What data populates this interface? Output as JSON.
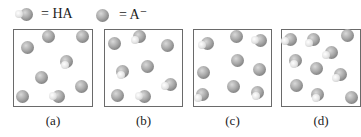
{
  "legend": [
    {
      "species": "HA",
      "label": "= HA",
      "symbol": "ha-molecule"
    },
    {
      "species": "A-",
      "label": "= A⁻",
      "symbol": "a-minus-ion"
    }
  ],
  "colors": {
    "sphere": "#9a9a9a",
    "hydrogen": "#eeeeee",
    "border": "#6a6a6a"
  },
  "panels": [
    {
      "label": "(a)",
      "x": 13,
      "width": 80,
      "particles": [
        {
          "type": "A-",
          "x": 49,
          "y": 37
        },
        {
          "type": "A-",
          "x": 83,
          "y": 37
        },
        {
          "type": "A-",
          "x": 28,
          "y": 48
        },
        {
          "type": "HA",
          "x": 67,
          "y": 62
        },
        {
          "type": "A-",
          "x": 42,
          "y": 78
        },
        {
          "type": "A-",
          "x": 82,
          "y": 87
        },
        {
          "type": "A-",
          "x": 23,
          "y": 97
        },
        {
          "type": "HA",
          "x": 59,
          "y": 97
        }
      ]
    },
    {
      "label": "(b)",
      "x": 104,
      "width": 79,
      "particles": [
        {
          "type": "A-",
          "x": 115,
          "y": 44
        },
        {
          "type": "HA",
          "x": 140,
          "y": 37
        },
        {
          "type": "A-",
          "x": 168,
          "y": 46
        },
        {
          "type": "HA",
          "x": 123,
          "y": 72
        },
        {
          "type": "A-",
          "x": 148,
          "y": 67
        },
        {
          "type": "HA",
          "x": 171,
          "y": 85
        },
        {
          "type": "A-",
          "x": 118,
          "y": 96
        },
        {
          "type": "HA",
          "x": 145,
          "y": 97
        }
      ]
    },
    {
      "label": "(c)",
      "x": 193,
      "width": 79,
      "particles": [
        {
          "type": "HA",
          "x": 208,
          "y": 44
        },
        {
          "type": "A-",
          "x": 237,
          "y": 37
        },
        {
          "type": "HA",
          "x": 261,
          "y": 41
        },
        {
          "type": "A-",
          "x": 238,
          "y": 61
        },
        {
          "type": "A-",
          "x": 204,
          "y": 73
        },
        {
          "type": "A-",
          "x": 260,
          "y": 70
        },
        {
          "type": "HA",
          "x": 203,
          "y": 95
        },
        {
          "type": "A-",
          "x": 234,
          "y": 87
        },
        {
          "type": "HA",
          "x": 258,
          "y": 93
        }
      ]
    },
    {
      "label": "(d)",
      "x": 281,
      "width": 80,
      "particles": [
        {
          "type": "HA",
          "x": 291,
          "y": 40
        },
        {
          "type": "HA",
          "x": 314,
          "y": 40
        },
        {
          "type": "A-",
          "x": 348,
          "y": 36
        },
        {
          "type": "HA",
          "x": 296,
          "y": 61
        },
        {
          "type": "HA",
          "x": 332,
          "y": 53
        },
        {
          "type": "A-",
          "x": 317,
          "y": 69
        },
        {
          "type": "HA",
          "x": 341,
          "y": 75
        },
        {
          "type": "A-",
          "x": 297,
          "y": 86
        },
        {
          "type": "HA",
          "x": 318,
          "y": 95
        },
        {
          "type": "A-",
          "x": 352,
          "y": 98
        }
      ]
    }
  ]
}
